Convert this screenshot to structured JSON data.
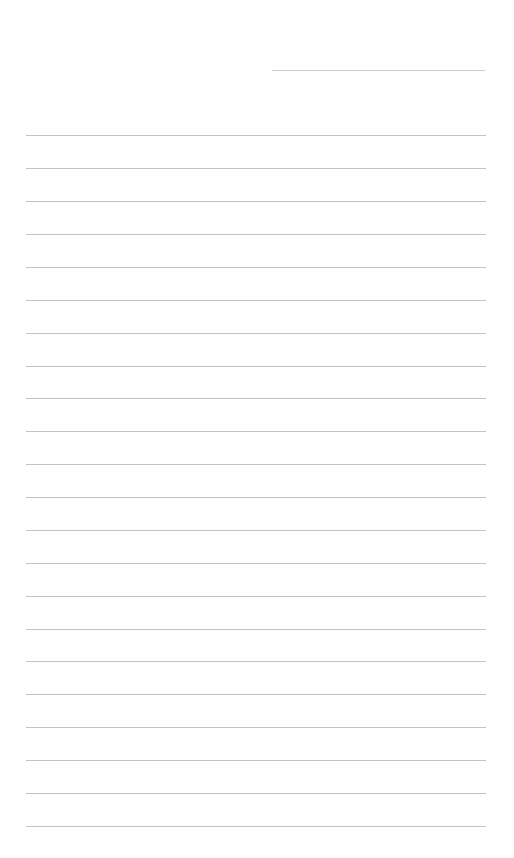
{
  "page": {
    "type": "lined-paper",
    "background_color": "#fefefe",
    "line_color": "#b8b8b8",
    "header_line": {
      "x1": 272,
      "x2": 485,
      "y": 70
    },
    "body_lines": {
      "x1": 26,
      "x2": 486,
      "y_positions": [
        135,
        168,
        201,
        234,
        267,
        300,
        333,
        366,
        398,
        431,
        464,
        497,
        530,
        563,
        596,
        629,
        661,
        694,
        727,
        760,
        793,
        826
      ]
    }
  }
}
